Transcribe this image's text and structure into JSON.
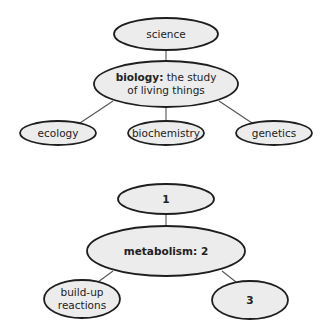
{
  "diagram1": {
    "root": {
      "label": "science"
    },
    "center": {
      "term": "biology:",
      "definition_line1": "the study",
      "definition_line2": "of living things"
    },
    "children": [
      {
        "label": "ecology"
      },
      {
        "label": "biochemistry"
      },
      {
        "label": "genetics"
      }
    ]
  },
  "diagram2": {
    "root": {
      "label": "1"
    },
    "center": {
      "label": "metabolism: 2"
    },
    "children": [
      {
        "label_line1": "build-up",
        "label_line2": "reactions"
      },
      {
        "label": "3"
      }
    ]
  },
  "colors": {
    "node_fill": "#ececec",
    "node_stroke": "#1e1e1e",
    "edge": "#555555"
  }
}
